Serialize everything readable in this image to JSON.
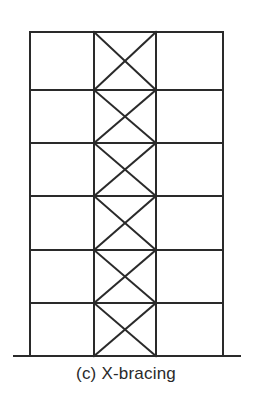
{
  "diagram": {
    "title": "(c) X-bracing",
    "type": "braced building frame",
    "stories": 6,
    "bays": 3,
    "braced_bay_index": 1,
    "bracing": "X-bracing",
    "geometry": {
      "column_x": [
        30,
        94,
        156,
        223
      ],
      "floor_y": [
        32,
        90,
        143,
        196,
        250,
        303,
        356
      ],
      "ground": {
        "x1": 13,
        "x2": 241,
        "y": 356
      }
    },
    "colors": {
      "stroke": "#2a2a2a",
      "background": "#ffffff"
    }
  }
}
